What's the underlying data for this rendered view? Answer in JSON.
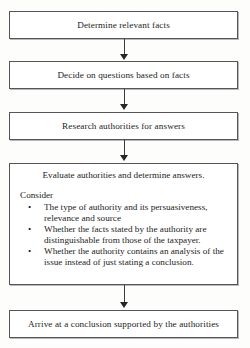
{
  "diagram": {
    "type": "flowchart",
    "orientation": "vertical",
    "accent_color": "#55555a",
    "background_color": "#fdfdfc",
    "arrow_color": "#262629"
  },
  "nodes": [
    {
      "id": "determine-facts",
      "label": "Determine relevant facts"
    },
    {
      "id": "decide-questions",
      "label": "Decide on questions based on facts"
    },
    {
      "id": "research-authorities",
      "label": "Research authorities for answers"
    },
    {
      "id": "evaluate-authorities",
      "title": "Evaluate authorities and determine answers.",
      "consider_label": "Consider",
      "bullet_glyph": "•",
      "bullets": [
        "The type of authority and its persuasiveness, relevance and source",
        "Whether the facts stated by the authority are distinguishable from those of the taxpayer.",
        "Whether the authority contains an analysis of the issue instead of just stating a conclusion."
      ]
    },
    {
      "id": "arrive-conclusion",
      "label": "Arrive at a conclusion supported by the authorities"
    }
  ]
}
